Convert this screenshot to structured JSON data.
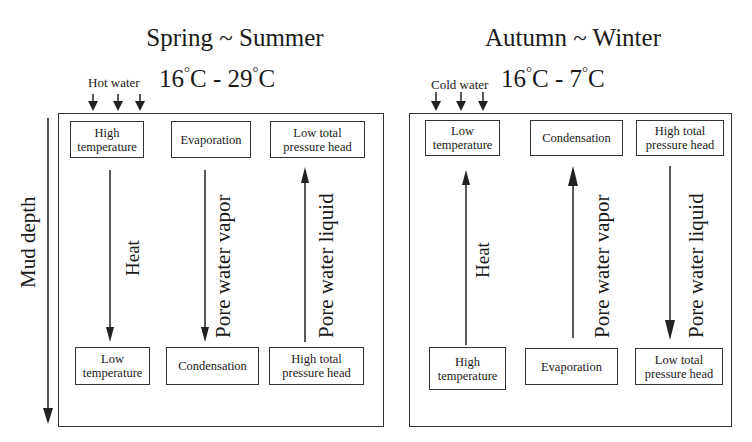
{
  "axis": {
    "label": "Mud depth",
    "direction": "down"
  },
  "panels": [
    {
      "id": "spring-summer",
      "title": "Spring ~ Summer",
      "temp_from": "16",
      "temp_to": "29",
      "temp_unit": "C",
      "temp_sep": " - ",
      "water_label": "Hot water",
      "columns": [
        {
          "top": [
            "High",
            "temperature"
          ],
          "bottom": [
            "Low",
            "temperature"
          ],
          "flow_label": "Heat",
          "direction": "down"
        },
        {
          "top": [
            "Evaporation"
          ],
          "bottom": [
            "Condensation"
          ],
          "flow_label": "Pore water vapor",
          "direction": "down"
        },
        {
          "top": [
            "Low total",
            "pressure head"
          ],
          "bottom": [
            "High total",
            "pressure head"
          ],
          "flow_label": "Pore water liquid",
          "direction": "up"
        }
      ]
    },
    {
      "id": "autumn-winter",
      "title": "Autumn ~ Winter",
      "temp_from": "16",
      "temp_to": "7",
      "temp_unit": "C",
      "temp_sep": " - ",
      "water_label": "Cold water",
      "columns": [
        {
          "top": [
            "Low",
            "temperature"
          ],
          "bottom": [
            "High",
            "temperature"
          ],
          "flow_label": "Heat",
          "direction": "up"
        },
        {
          "top": [
            "Condensation"
          ],
          "bottom": [
            "Evaporation"
          ],
          "flow_label": "Pore water vapor",
          "direction": "up"
        },
        {
          "top": [
            "High total",
            "pressure head"
          ],
          "bottom": [
            "Low total",
            "pressure head"
          ],
          "flow_label": "Pore water liquid",
          "direction": "down"
        }
      ]
    }
  ],
  "colors": {
    "line": "#222222",
    "background": "#ffffff"
  }
}
